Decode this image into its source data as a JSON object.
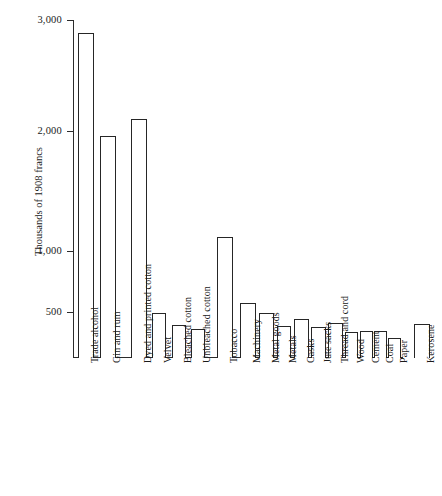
{
  "chart_data": {
    "type": "bar",
    "title": "",
    "xlabel": "",
    "ylabel": "Thousands of 1908 francs",
    "ylim": [
      0,
      3000
    ],
    "yticks": [
      500,
      1000,
      2000,
      3000
    ],
    "ytick_labels": [
      "500",
      "1,000",
      "2,000",
      "3,000"
    ],
    "grid": false,
    "legend": null,
    "categories": [
      "Trade alcohol",
      "Gin and rum",
      "Dyed and printed cotton",
      "Velvet",
      "Bleached cotton",
      "Unbleached cotton",
      "Tobacco",
      "Machinery",
      "Metal goods",
      "Metals",
      "Casks",
      "Jute sacks",
      "Thread and cord",
      "Wood",
      "Cement",
      "Coal",
      "Paper",
      "Kerosene"
    ],
    "values": [
      2880,
      1960,
      2110,
      490,
      360,
      315,
      1120,
      570,
      490,
      340,
      425,
      330,
      375,
      275,
      290,
      290,
      210,
      370
    ]
  },
  "style": {
    "bar_stroke": "#262626",
    "bar_fill": "#ffffff",
    "axis_color": "#2b2b2b",
    "background": "#ffffff"
  }
}
